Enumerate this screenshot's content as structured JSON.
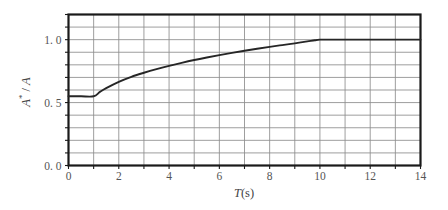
{
  "chart_data": {
    "type": "line",
    "title": "",
    "xlabel": "T(s)",
    "ylabel": "A* / A",
    "xlim": [
      0,
      14
    ],
    "ylim": [
      0.0,
      1.2
    ],
    "grid": true,
    "legend": null,
    "x_ticks": [
      0,
      1,
      2,
      3,
      4,
      5,
      6,
      7,
      8,
      9,
      10,
      11,
      12,
      13,
      14
    ],
    "x_tick_labels": [
      "0",
      "",
      "2",
      "",
      "4",
      "",
      "6",
      "",
      "8",
      "",
      "10",
      "",
      "12",
      "",
      "14"
    ],
    "y_ticks": [
      0.0,
      0.1,
      0.2,
      0.3,
      0.4,
      0.5,
      0.6,
      0.7,
      0.8,
      0.9,
      1.0,
      1.1,
      1.2
    ],
    "y_tick_labels": [
      "0. 0",
      "",
      "",
      "",
      "",
      "0. 5",
      "",
      "",
      "",
      "",
      "1. 0",
      "",
      ""
    ],
    "series": [
      {
        "name": "A*/A",
        "color": "#262626",
        "x": [
          0.0,
          0.5,
          1.0,
          1.25,
          1.5,
          2.0,
          2.5,
          3.0,
          3.5,
          4.0,
          4.5,
          5.0,
          5.5,
          6.0,
          6.5,
          7.0,
          7.5,
          8.0,
          8.5,
          9.0,
          9.5,
          9.8,
          10.0,
          11.0,
          12.0,
          13.0,
          14.0
        ],
        "y": [
          0.55,
          0.55,
          0.55,
          0.585,
          0.615,
          0.665,
          0.705,
          0.737,
          0.766,
          0.792,
          0.816,
          0.838,
          0.858,
          0.877,
          0.895,
          0.912,
          0.928,
          0.943,
          0.957,
          0.971,
          0.986,
          0.995,
          1.0,
          1.0,
          1.0,
          1.0,
          1.0
        ]
      }
    ],
    "annotations": []
  },
  "axis": {
    "x_title": "T(s)",
    "x_title_italic": "T",
    "x_title_rest": "(s)",
    "y_title_numerator": "A*",
    "y_title_slash": "/",
    "y_title_denominator": "A"
  },
  "style": {
    "frame_color": "#1a1a1a",
    "grid_color": "#8d8d8d",
    "curve_color": "#262626",
    "text_color": "#555555",
    "background": "#ffffff"
  }
}
